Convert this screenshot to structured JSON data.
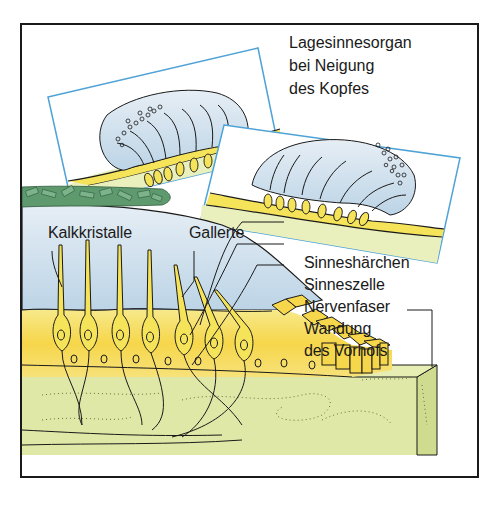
{
  "diagram": {
    "title_lines": [
      "Lagesinnesorgan",
      "bei Neigung",
      "des Kopfes"
    ],
    "labels": {
      "kalkkristalle": "Kalkkristalle",
      "gallerte": "Gallerte",
      "sinneshaerchen": "Sinneshärchen",
      "sinneszelle": "Sinneszelle",
      "nervenfaser": "Nervenfaser",
      "wandung_line1": "Wandung",
      "wandung_line2": "des Vorhofs"
    },
    "colors": {
      "frame": "#1a1a1a",
      "inset_border": "#4fa3d6",
      "gel_blue": "#c9dcea",
      "cell_yellow": "#f5e35a",
      "cell_yellow_dark": "#f0c93a",
      "tissue_green": "#dfe8a6",
      "crystal_green": "#5f9a6e",
      "outline": "#1a1a1a"
    }
  }
}
